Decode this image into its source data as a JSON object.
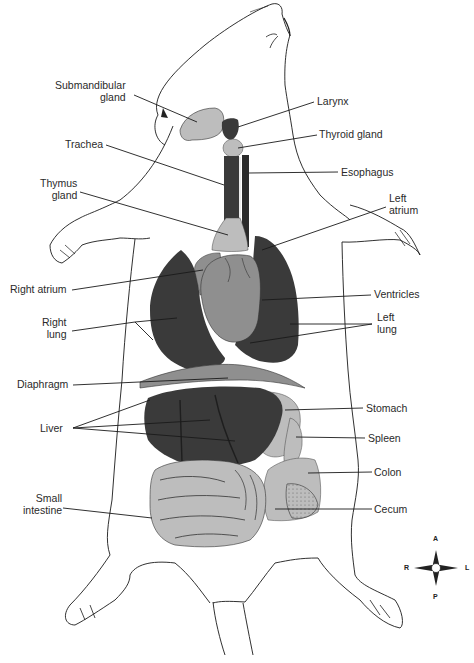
{
  "figure": {
    "colors": {
      "dark_organ": "#3a3a3a",
      "mid_organ": "#8f8f8f",
      "light_organ": "#bdbdbd",
      "outline": "#1a1a1a",
      "label_text": "#2a2a2a",
      "background": "#ffffff"
    }
  },
  "labels": {
    "submandibular_gland": [
      "Submandibular",
      "gland"
    ],
    "larynx": "Larynx",
    "thyroid_gland": "Thyroid gland",
    "trachea": "Trachea",
    "esophagus": "Esophagus",
    "thymus_gland": [
      "Thymus",
      "gland"
    ],
    "left_atrium": [
      "Left",
      "atrium"
    ],
    "right_atrium": "Right atrium",
    "ventricles": "Ventricles",
    "right_lung": [
      "Right",
      "lung"
    ],
    "left_lung": [
      "Left",
      "lung"
    ],
    "diaphragm": "Diaphragm",
    "liver": "Liver",
    "stomach": "Stomach",
    "spleen": "Spleen",
    "colon": "Colon",
    "cecum": "Cecum",
    "small_intestine": [
      "Small",
      "intestine"
    ]
  },
  "compass": {
    "anterior": "A",
    "posterior": "P",
    "right": "R",
    "left": "L"
  }
}
